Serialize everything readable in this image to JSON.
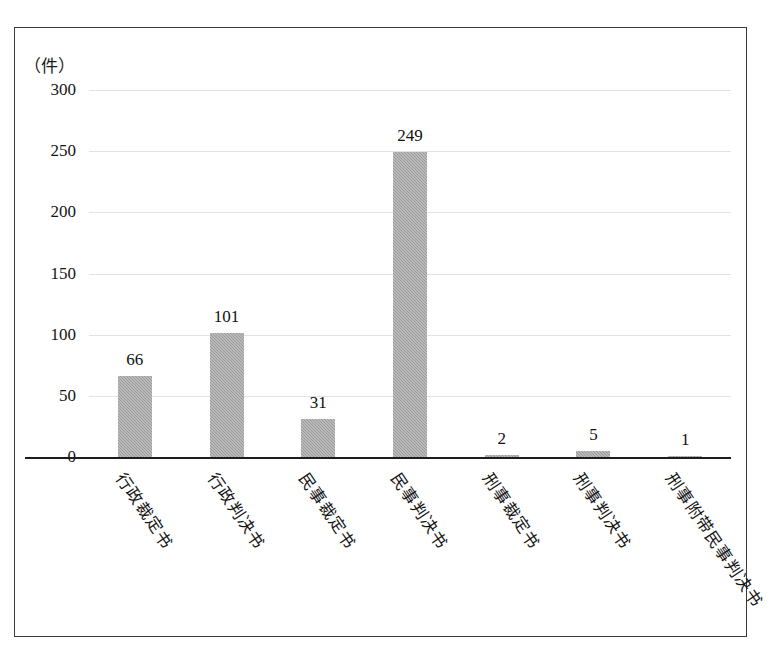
{
  "figure": {
    "unit_label": "（件）",
    "border_color": "#3a3a3a",
    "background_color": "#ffffff"
  },
  "chart_data": {
    "type": "bar",
    "title": "",
    "subtitle": "",
    "xlabel": "",
    "ylabel": "（件）",
    "ylim": [
      0,
      300
    ],
    "ytick_labels": [
      "0",
      "50",
      "100",
      "150",
      "200",
      "250",
      "300"
    ],
    "ytick_values": [
      0,
      50,
      100,
      150,
      200,
      250,
      300
    ],
    "grid": true,
    "grid_color": "#e2e2e2",
    "legend": "none",
    "bar_color": "#9b9b9b",
    "categories": [
      "行政裁定书",
      "行政判决书",
      "民事裁定书",
      "民事判决书",
      "刑事裁定书",
      "刑事判决书",
      "刑事附带民事判决书"
    ],
    "values": [
      66,
      101,
      31,
      249,
      2,
      5,
      1
    ],
    "data_labels": [
      "66",
      "101",
      "31",
      "249",
      "2",
      "5",
      "1"
    ]
  }
}
